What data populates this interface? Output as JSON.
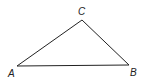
{
  "diagram": {
    "type": "triangle",
    "stroke_color": "#222222",
    "vertices": [
      {
        "name": "A",
        "x": 17,
        "y": 66,
        "label_x": 8,
        "label_y": 77
      },
      {
        "name": "B",
        "x": 129,
        "y": 65,
        "label_x": 130,
        "label_y": 76
      },
      {
        "name": "C",
        "x": 82,
        "y": 20,
        "label_x": 78,
        "label_y": 15
      }
    ],
    "labels": {
      "a": "A",
      "b": "B",
      "c": "C"
    }
  }
}
